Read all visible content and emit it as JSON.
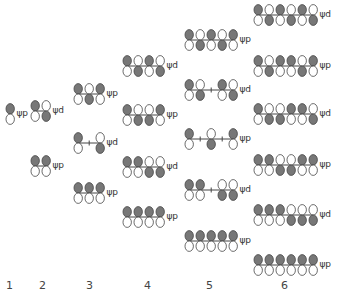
{
  "diagram": {
    "colors": {
      "filled": "#777777",
      "empty": "#ffffff",
      "stroke": "#444444"
    },
    "columns": [
      {
        "label": "1",
        "x": 5,
        "orbitals": [
          {
            "type": "ψp",
            "y": 103,
            "top": [
              "F"
            ]
          }
        ]
      },
      {
        "label": "2",
        "x": 30,
        "orbitals": [
          {
            "type": "ψd",
            "y": 100,
            "top": [
              "F",
              "E"
            ]
          },
          {
            "type": "ψp",
            "y": 155,
            "top": [
              "F",
              "F"
            ]
          }
        ]
      },
      {
        "label": "3",
        "x": 73,
        "orbitals": [
          {
            "type": "ψp",
            "y": 83,
            "top": [
              "F",
              "E",
              "F"
            ]
          },
          {
            "type": "ψd",
            "y": 132,
            "top": [
              "F",
              "N",
              "E"
            ],
            "bottom_override": [
              "E",
              "N",
              "F"
            ]
          },
          {
            "type": "ψp",
            "y": 182,
            "top": [
              "F",
              "F",
              "F"
            ]
          }
        ]
      },
      {
        "label": "4",
        "x": 122,
        "orbitals": [
          {
            "type": "ψd",
            "y": 55,
            "top": [
              "F",
              "E",
              "F",
              "E"
            ]
          },
          {
            "type": "ψp",
            "y": 104,
            "top": [
              "F",
              "E",
              "E",
              "F"
            ]
          },
          {
            "type": "ψd",
            "y": 156,
            "top": [
              "F",
              "F",
              "E",
              "E"
            ]
          },
          {
            "type": "ψp",
            "y": 206,
            "top": [
              "F",
              "F",
              "F",
              "F"
            ]
          }
        ]
      },
      {
        "label": "5",
        "x": 184,
        "orbitals": [
          {
            "type": "ψp",
            "y": 29,
            "top": [
              "F",
              "E",
              "F",
              "E",
              "F"
            ]
          },
          {
            "type": "ψd",
            "y": 79,
            "top": [
              "F",
              "E",
              "N",
              "F",
              "E"
            ]
          },
          {
            "type": "ψp",
            "y": 128,
            "top": [
              "F",
              "N",
              "E",
              "N",
              "F"
            ]
          },
          {
            "type": "ψd",
            "y": 179,
            "top": [
              "F",
              "F",
              "N",
              "E",
              "E"
            ]
          },
          {
            "type": "ψp",
            "y": 230,
            "top": [
              "F",
              "F",
              "F",
              "F",
              "F"
            ]
          }
        ]
      },
      {
        "label": "6",
        "x": 253,
        "orbitals": [
          {
            "type": "ψd",
            "y": 4,
            "top": [
              "F",
              "E",
              "F",
              "E",
              "F",
              "E"
            ]
          },
          {
            "type": "ψp",
            "y": 55,
            "top": [
              "F",
              "E",
              "F",
              "F",
              "E",
              "F"
            ]
          },
          {
            "type": "ψd",
            "y": 103,
            "top": [
              "F",
              "E",
              "E",
              "F",
              "F",
              "E"
            ]
          },
          {
            "type": "ψp",
            "y": 154,
            "top": [
              "F",
              "F",
              "E",
              "E",
              "F",
              "F"
            ]
          },
          {
            "type": "ψd",
            "y": 204,
            "top": [
              "F",
              "F",
              "F",
              "E",
              "E",
              "E"
            ]
          },
          {
            "type": "ψp",
            "y": 254,
            "top": [
              "F",
              "F",
              "F",
              "F",
              "F",
              "F"
            ]
          }
        ]
      }
    ],
    "column_labels": [
      "1",
      "2",
      "3",
      "4",
      "5",
      "6"
    ],
    "column_label_x": [
      6,
      39,
      86,
      144,
      206,
      281
    ]
  }
}
